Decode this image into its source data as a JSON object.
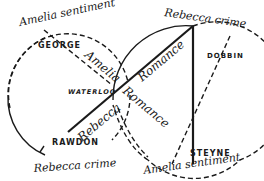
{
  "diagram": {
    "arc_labels": {
      "left_top": "Amelia sentiment",
      "left_bottom": "Rebecca crime",
      "right_top": "Rebecca crime",
      "right_bottom": "Amelia sentiment"
    },
    "line_labels": {
      "amelia": "Amelia",
      "rebecca": "Rebecca",
      "romance_upper": "Romance",
      "romance_lower": "Romance"
    },
    "nodes": {
      "george": "GEORGE",
      "waterloo": "WATERLOO",
      "rawdon": "RAWDON",
      "dobbin": "DOBBIN",
      "steyne": "STEYNE"
    },
    "colors": {
      "ink": "#1a1a1a",
      "background": "#ffffff"
    }
  }
}
